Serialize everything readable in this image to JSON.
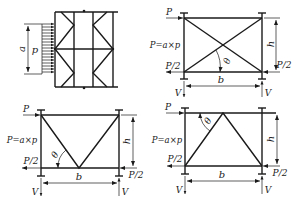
{
  "figure": {
    "panels": [
      {
        "id": "braced-frame-with-distributed-load",
        "labels": {
          "dimension": "a",
          "load": "p"
        }
      },
      {
        "id": "x-braced-frame",
        "labels": {
          "top_load": "P",
          "total_load": "P=a×p",
          "bottom_left": "P/2",
          "bottom_right": "P/2",
          "height": "h",
          "width": "b",
          "angle": "θ",
          "reaction_left": "V",
          "reaction_right": "V"
        }
      },
      {
        "id": "v-braced-frame",
        "labels": {
          "top_load": "P",
          "total_load": "P=a×p",
          "bottom_left": "P/2",
          "bottom_right": "P/2",
          "height": "h",
          "width": "b",
          "angle": "θ",
          "reaction_left": "V",
          "reaction_right": "V"
        }
      },
      {
        "id": "inverted-v-braced-frame",
        "labels": {
          "top_load": "P",
          "total_load": "P=a×p",
          "bottom_left": "P/2",
          "bottom_right": "P/2",
          "height": "h",
          "width": "b",
          "angle": "θ",
          "reaction_left": "V",
          "reaction_right": "V"
        }
      }
    ],
    "colors": {
      "line": "#1a1a1a",
      "background": "#ffffff"
    }
  }
}
